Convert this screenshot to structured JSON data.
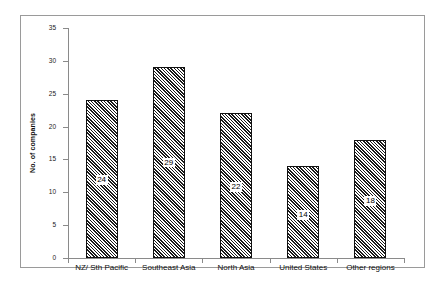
{
  "chart_data": {
    "type": "bar",
    "title": "",
    "subtitle": "",
    "xlabel": "",
    "ylabel": "No. of companies",
    "categories": [
      "NZ/ Sth Pacific",
      "Southeast Asia",
      "North Asia",
      "United States",
      "Other regions"
    ],
    "values": [
      24,
      29,
      22,
      14,
      18
    ],
    "data_labels": [
      "24",
      "29",
      "22",
      "14",
      "18"
    ],
    "ylim": [
      0,
      35
    ],
    "ytick_labels": [
      "0",
      "5",
      "10",
      "15",
      "20",
      "25",
      "30",
      "35"
    ],
    "ytick_values": [
      0,
      5,
      10,
      15,
      20,
      25,
      30,
      35
    ],
    "grid": false,
    "legend": null,
    "bar_fill": "diagonal-hatch",
    "colors": {
      "bar_outline": "#111111",
      "hatch": "#1a1a1a",
      "background": "#ffffff",
      "axis": "#8a8a8a",
      "frame": "#9a9a9a"
    }
  }
}
